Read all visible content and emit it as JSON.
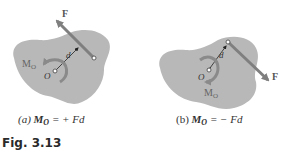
{
  "panels": [
    {
      "id": "a",
      "force_label": "F",
      "moment_label": "M",
      "moment_subscript": "O",
      "point_label": "O",
      "distance_label": "d",
      "caption_prefix": "(a)",
      "caption_lhs": "M",
      "caption_sub": "O",
      "caption_rhs": "= + Fd",
      "rotation": "counterclockwise"
    },
    {
      "id": "b",
      "force_label": "F",
      "moment_label": "M",
      "moment_subscript": "O",
      "point_label": "O",
      "distance_label": "d",
      "caption_prefix": "(b)",
      "caption_lhs": "M",
      "caption_sub": "O",
      "caption_rhs": "= − Fd",
      "rotation": "clockwise"
    }
  ],
  "figure_label": "Fig. 3.13",
  "colors": {
    "body_fill": "#b8b8b8",
    "force_arrow": "#7f7f7f",
    "moment_arrow": "#8a8a8a",
    "label_text": "#555555"
  }
}
